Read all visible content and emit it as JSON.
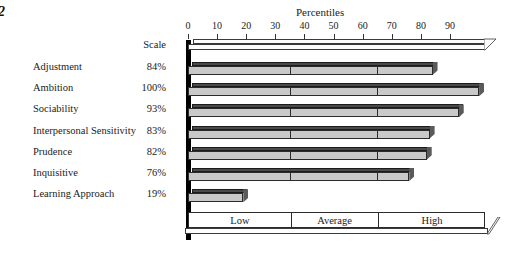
{
  "page_number": "2",
  "chart_data": {
    "type": "bar",
    "title": "Percentiles",
    "xlabel": "",
    "ylabel": "",
    "orientation": "horizontal",
    "xlim": [
      0,
      102
    ],
    "ticks": [
      0,
      10,
      20,
      30,
      40,
      50,
      60,
      70,
      80,
      90
    ],
    "tick_labels": [
      "0",
      "10",
      "20",
      "30",
      "40",
      "50",
      "60",
      "70",
      "80",
      "90"
    ],
    "grid": false,
    "scale_label": "Scale",
    "value_suffix": "%",
    "band_dividers": [
      35,
      65
    ],
    "categories": [
      "Adjustment",
      "Ambition",
      "Sociability",
      "Interpersonal Sensitivity",
      "Prudence",
      "Inquisitive",
      "Learning Approach"
    ],
    "values": [
      84,
      100,
      93,
      83,
      82,
      76,
      19
    ],
    "value_labels": [
      "84%",
      "100%",
      "93%",
      "83%",
      "82%",
      "76%",
      "19%"
    ],
    "bands": [
      {
        "label": "Low",
        "start": 0,
        "end": 35
      },
      {
        "label": "Average",
        "start": 35,
        "end": 65
      },
      {
        "label": "High",
        "start": 65,
        "end": 102
      }
    ],
    "colors": {
      "bar_face": "#c9c9c9",
      "bar_top": "#4a4a4a",
      "bar_side": "#5a5a5a",
      "outline": "#2b2b2b",
      "axis": "#000000",
      "text": "#1b1b1b"
    }
  }
}
